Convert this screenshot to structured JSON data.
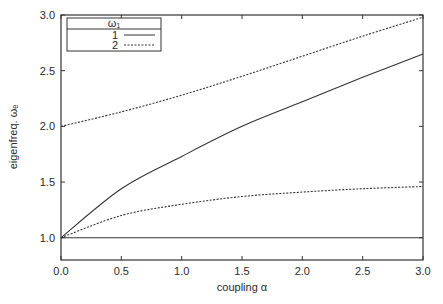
{
  "chart_data": {
    "type": "line",
    "title": "",
    "xlabel": "coupling α",
    "ylabel": "eigenfreq. ωₑ",
    "xlim": [
      0.0,
      3.0
    ],
    "ylim": [
      0.8,
      3.0
    ],
    "x_ticks": [
      "0.0",
      "0.5",
      "1.0",
      "1.5",
      "2.0",
      "2.5",
      "3.0"
    ],
    "y_ticks": [
      "1.0",
      "1.5",
      "2.0",
      "2.5",
      "3.0"
    ],
    "grid": false,
    "legend": {
      "position": "upper left",
      "title": "ω₁",
      "entries": [
        {
          "label": "1",
          "style": "solid"
        },
        {
          "label": "2",
          "style": "dashed"
        }
      ]
    },
    "x": [
      0.0,
      0.5,
      1.0,
      1.5,
      2.0,
      2.5,
      3.0
    ],
    "series": [
      {
        "name": "1",
        "branch": "lower",
        "style": "solid",
        "values": [
          1.0,
          1.0,
          1.0,
          1.0,
          1.0,
          1.0,
          1.0
        ]
      },
      {
        "name": "1",
        "branch": "upper",
        "style": "solid",
        "values": [
          1.0,
          1.44,
          1.73,
          2.0,
          2.22,
          2.44,
          2.65
        ]
      },
      {
        "name": "2",
        "branch": "lower",
        "style": "dashed",
        "values": [
          1.0,
          1.2,
          1.3,
          1.37,
          1.41,
          1.44,
          1.46
        ]
      },
      {
        "name": "2",
        "branch": "upper",
        "style": "dashed",
        "values": [
          2.0,
          2.13,
          2.28,
          2.45,
          2.63,
          2.81,
          2.98
        ]
      }
    ]
  },
  "colors": {
    "line": "#333333",
    "axis": "#333333",
    "background": "#ffffff"
  }
}
